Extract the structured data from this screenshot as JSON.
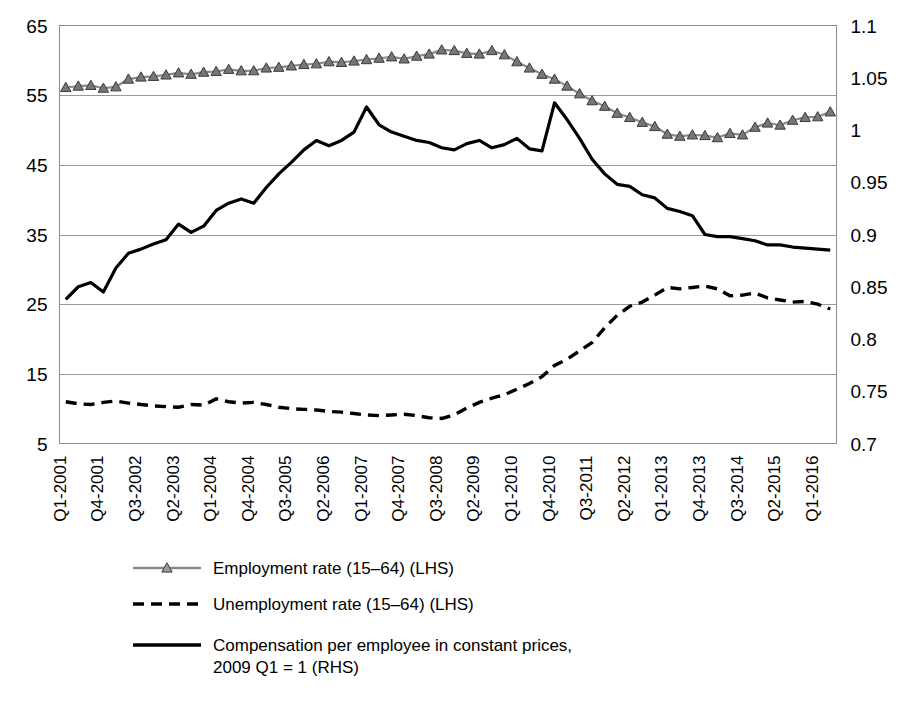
{
  "chart_data": {
    "type": "line",
    "title": "",
    "subtitle": "",
    "xlabel": "",
    "ylabel": "",
    "grid": true,
    "legend_position": "bottom-left",
    "axes": {
      "left": {
        "label": "",
        "ticks": [
          5,
          15,
          25,
          35,
          45,
          55,
          65
        ],
        "tick_labels": [
          "5",
          "15",
          "25",
          "35",
          "45",
          "55",
          "65"
        ],
        "ylim": [
          5,
          65
        ],
        "side": "left",
        "applies_to": [
          "Employment rate (15–64) (LHS)",
          "Unemployment rate (15–64) (LHS)"
        ]
      },
      "right": {
        "label": "",
        "ticks": [
          0.7,
          0.75,
          0.8,
          0.85,
          0.9,
          0.95,
          1,
          1.05,
          1.1
        ],
        "tick_labels": [
          "0.7",
          "0.75",
          "0.8",
          "0.85",
          "0.9",
          "0.95",
          "1",
          "1.05",
          "1.1"
        ],
        "ylim": [
          0.7,
          1.1
        ],
        "side": "right",
        "applies_to": [
          "Compensation per employee in constant prices, 2009 Q1 = 1 (RHS)"
        ]
      }
    },
    "x": [
      "Q1-2001",
      "Q2-2001",
      "Q3-2001",
      "Q4-2001",
      "Q1-2002",
      "Q2-2002",
      "Q3-2002",
      "Q4-2002",
      "Q1-2003",
      "Q2-2003",
      "Q3-2003",
      "Q4-2003",
      "Q1-2004",
      "Q2-2004",
      "Q3-2004",
      "Q4-2004",
      "Q1-2005",
      "Q2-2005",
      "Q3-2005",
      "Q4-2005",
      "Q1-2006",
      "Q2-2006",
      "Q3-2006",
      "Q4-2006",
      "Q1-2007",
      "Q2-2007",
      "Q3-2007",
      "Q4-2007",
      "Q1-2008",
      "Q2-2008",
      "Q3-2008",
      "Q4-2008",
      "Q1-2009",
      "Q2-2009",
      "Q3-2009",
      "Q4-2009",
      "Q1-2010",
      "Q2-2010",
      "Q3-2010",
      "Q4-2010",
      "Q1-2011",
      "Q2-2011",
      "Q3-2011",
      "Q4-2011",
      "Q1-2012",
      "Q2-2012",
      "Q3-2012",
      "Q4-2012",
      "Q1-2013",
      "Q2-2013",
      "Q3-2013",
      "Q4-2013",
      "Q1-2014",
      "Q2-2014",
      "Q3-2014",
      "Q4-2014",
      "Q1-2015",
      "Q2-2015",
      "Q3-2015",
      "Q4-2015",
      "Q1-2016",
      "Q2-2016"
    ],
    "x_tick_labels": [
      "Q1-2001",
      "Q4-2001",
      "Q3-2002",
      "Q2-2003",
      "Q1-2004",
      "Q4-2004",
      "Q3-2005",
      "Q2-2006",
      "Q1-2007",
      "Q4-2007",
      "Q3-2008",
      "Q2-2009",
      "Q1-2010",
      "Q4-2010",
      "Q3-2011",
      "Q2-2012",
      "Q1-2013",
      "Q4-2013",
      "Q3-2014",
      "Q2-2015",
      "Q1-2016"
    ],
    "x_tick_every": 3,
    "series": [
      {
        "name": "Employment rate (15–64) (LHS)",
        "axis": "left",
        "style": "line-marker",
        "marker": "triangle",
        "color": "#8a8a8a",
        "values": [
          56.1,
          56.3,
          56.4,
          56.0,
          56.2,
          57.3,
          57.6,
          57.7,
          57.9,
          58.2,
          58.0,
          58.3,
          58.4,
          58.7,
          58.5,
          58.5,
          58.9,
          59.0,
          59.2,
          59.4,
          59.5,
          59.8,
          59.7,
          59.9,
          60.1,
          60.3,
          60.5,
          60.2,
          60.6,
          60.9,
          61.5,
          61.4,
          61.0,
          60.9,
          61.4,
          60.8,
          59.8,
          58.9,
          58.0,
          57.3,
          56.3,
          55.2,
          54.2,
          53.4,
          52.4,
          51.8,
          51.1,
          50.5,
          49.4,
          49.1,
          49.3,
          49.2,
          48.9,
          49.5,
          49.3,
          50.4,
          51.0,
          50.7,
          51.4,
          51.8,
          51.9,
          52.6
        ]
      },
      {
        "name": "Unemployment rate (15–64) (LHS)",
        "axis": "left",
        "style": "dashed",
        "color": "#000000",
        "values": [
          11.0,
          10.7,
          10.6,
          10.9,
          11.1,
          10.8,
          10.6,
          10.4,
          10.3,
          10.2,
          10.6,
          10.5,
          11.4,
          11.0,
          10.8,
          10.9,
          10.6,
          10.2,
          10.0,
          9.9,
          9.8,
          9.6,
          9.5,
          9.3,
          9.1,
          9.0,
          9.1,
          9.2,
          9.0,
          8.7,
          8.6,
          9.1,
          10.1,
          10.9,
          11.5,
          12.0,
          12.8,
          13.6,
          14.6,
          16.2,
          17.1,
          18.3,
          19.5,
          21.6,
          23.4,
          24.7,
          25.3,
          26.3,
          27.4,
          27.2,
          27.4,
          27.6,
          27.2,
          26.2,
          26.3,
          26.6,
          25.9,
          25.6,
          25.3,
          25.4,
          25.0,
          24.3
        ]
      },
      {
        "name": "Compensation per employee in constant prices, 2009 Q1 = 1 (RHS)",
        "axis": "right",
        "style": "solid",
        "color": "#000000",
        "values": [
          0.838,
          0.85,
          0.854,
          0.845,
          0.868,
          0.882,
          0.886,
          0.891,
          0.895,
          0.91,
          0.902,
          0.908,
          0.923,
          0.93,
          0.934,
          0.93,
          0.945,
          0.958,
          0.969,
          0.981,
          0.99,
          0.985,
          0.99,
          0.998,
          1.022,
          1.005,
          0.998,
          0.994,
          0.99,
          0.988,
          0.983,
          0.981,
          0.987,
          0.99,
          0.983,
          0.986,
          0.992,
          0.982,
          0.98,
          1.026,
          1.01,
          0.992,
          0.972,
          0.958,
          0.948,
          0.946,
          0.938,
          0.935,
          0.925,
          0.922,
          0.918,
          0.9,
          0.898,
          0.898,
          0.896,
          0.894,
          0.89,
          0.89,
          0.888,
          0.887,
          0.886,
          0.885
        ]
      }
    ],
    "legend": [
      {
        "label": "Employment rate (15–64) (LHS)",
        "style": "line-marker",
        "color": "#8a8a8a",
        "marker": "triangle"
      },
      {
        "label": "Unemployment rate (15–64) (LHS)",
        "style": "dashed",
        "color": "#000000",
        "marker": "none"
      },
      {
        "label": "Compensation per employee in constant prices,",
        "label_line2": "2009 Q1 = 1 (RHS)",
        "style": "solid",
        "color": "#000000",
        "marker": "none"
      }
    ]
  },
  "colors": {
    "employment": "#8a8a8a",
    "unemployment": "#000000",
    "compensation": "#000000",
    "gridline": "#9a9a9a",
    "frame": "#8c8c8c",
    "background": "#ffffff"
  }
}
